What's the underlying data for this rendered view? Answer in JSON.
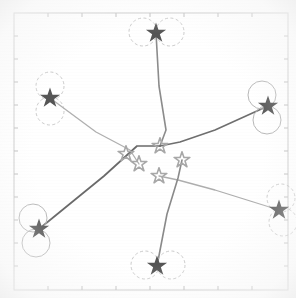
{
  "figure": {
    "title": "",
    "background_color": "#ffffff",
    "frame_color": "#c9c9c9",
    "tick_color": "#bdbdbd"
  },
  "chart_data": {
    "type": "scatter",
    "title": "",
    "subtitle": "",
    "xlabel": "",
    "ylabel": "",
    "xlim": [
      0,
      296
    ],
    "ylim": [
      0,
      298
    ],
    "grid": false,
    "legend": null,
    "plot_frame": {
      "x": 14,
      "y": 13,
      "width": 274,
      "height": 277
    },
    "axis_ticks": {
      "top": [
        48,
        82,
        116,
        150,
        184,
        218,
        252
      ],
      "bottom": [
        48,
        82,
        116,
        150,
        184,
        218,
        252
      ],
      "left": [
        36,
        59,
        82,
        105,
        128,
        151,
        174,
        197,
        220,
        243,
        266
      ],
      "right": [
        36,
        59,
        82,
        105,
        128,
        151,
        174,
        197,
        220,
        243,
        266
      ],
      "length": 4
    },
    "series": [
      {
        "name": "outer-nodes",
        "marker": "star-filled",
        "color": "#555555",
        "size": 11,
        "points": [
          {
            "id": "node-top",
            "x": 156,
            "y": 33,
            "label": ""
          },
          {
            "id": "node-upper-left",
            "x": 50,
            "y": 98,
            "label": ""
          },
          {
            "id": "node-upper-right",
            "x": 268,
            "y": 106,
            "label": ""
          },
          {
            "id": "node-lower-left",
            "x": 39,
            "y": 229,
            "label": ""
          },
          {
            "id": "node-lower-right",
            "x": 279,
            "y": 210,
            "label": ""
          },
          {
            "id": "node-bottom",
            "x": 157,
            "y": 266,
            "label": ""
          }
        ]
      },
      {
        "name": "center-cluster",
        "marker": "star-open",
        "color": "#a8a8a8",
        "size": 9,
        "points": [
          {
            "id": "center-a",
            "x": 160,
            "y": 146,
            "label": ""
          },
          {
            "id": "center-b",
            "x": 182,
            "y": 160,
            "label": ""
          },
          {
            "id": "center-c",
            "x": 159,
            "y": 176,
            "label": ""
          },
          {
            "id": "center-d",
            "x": 139,
            "y": 164,
            "label": ""
          },
          {
            "id": "center-e",
            "x": 126,
            "y": 154,
            "label": ""
          }
        ]
      }
    ],
    "uncertainty_circles": {
      "name": "node-rings",
      "color": "#b8b8b8",
      "radius": 14,
      "rings": [
        {
          "node": "node-top",
          "cx": 143,
          "cy": 32,
          "dashed": true
        },
        {
          "node": "node-top",
          "cx": 170,
          "cy": 32,
          "dashed": true
        },
        {
          "node": "node-upper-left",
          "cx": 50,
          "cy": 86,
          "dashed": true
        },
        {
          "node": "node-upper-left",
          "cx": 50,
          "cy": 111,
          "dashed": true
        },
        {
          "node": "node-upper-right",
          "cx": 262,
          "cy": 95,
          "dashed": false
        },
        {
          "node": "node-upper-right",
          "cx": 267,
          "cy": 120,
          "dashed": false
        },
        {
          "node": "node-lower-left",
          "cx": 33,
          "cy": 218,
          "dashed": false
        },
        {
          "node": "node-lower-left",
          "cx": 36,
          "cy": 243,
          "dashed": false
        },
        {
          "node": "node-lower-right",
          "cx": 281,
          "cy": 198,
          "dashed": true
        },
        {
          "node": "node-lower-right",
          "cx": 283,
          "cy": 222,
          "dashed": true
        },
        {
          "node": "node-bottom",
          "cx": 145,
          "cy": 265,
          "dashed": true
        },
        {
          "node": "node-bottom",
          "cx": 171,
          "cy": 265,
          "dashed": true
        }
      ]
    },
    "edges": [
      {
        "id": "edge-top",
        "from": "node-top",
        "to": "center-a",
        "color": "#8c8c8c",
        "width": 1.6,
        "path": "156,33 159,86 166,130 160,146"
      },
      {
        "id": "edge-upper-left",
        "from": "node-upper-left",
        "to": "center-d",
        "color": "#b0b0b0",
        "width": 1.3,
        "path": "50,98 96,132 130,150 139,164"
      },
      {
        "id": "edge-upper-right",
        "from": "node-upper-right",
        "to": "center-a",
        "color": "#6f6f6f",
        "width": 1.6,
        "path": "268,106 215,130 180,142 160,146"
      },
      {
        "id": "edge-lower-left",
        "from": "node-lower-left",
        "to": "center-a",
        "color": "#6a6a6a",
        "width": 1.7,
        "path": "39,229 104,176 137,146 160,146"
      },
      {
        "id": "edge-lower-right",
        "from": "node-lower-right",
        "to": "center-c",
        "color": "#aeaeae",
        "width": 1.3,
        "path": "279,210 215,190 178,180 159,176"
      },
      {
        "id": "edge-bottom",
        "from": "node-bottom",
        "to": "center-b",
        "color": "#8a8a8a",
        "width": 1.6,
        "path": "157,266 167,214 178,178 182,160"
      }
    ]
  }
}
